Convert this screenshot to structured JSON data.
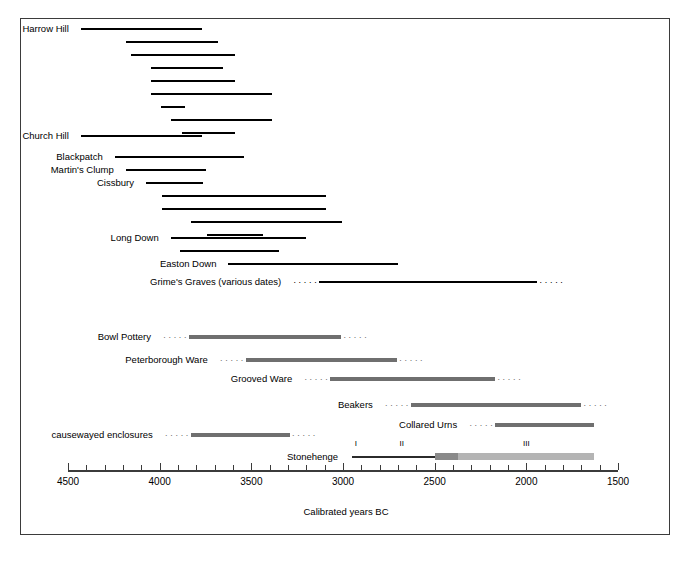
{
  "chart_data": {
    "type": "bar",
    "title": "",
    "xlabel": "Calibrated years BC",
    "ylabel": "",
    "xlim": [
      4500,
      1500
    ],
    "x_axis_reversed": true,
    "tick_interval": 100,
    "label_interval": 500,
    "tick_labels": [
      "4500",
      "4000",
      "3500",
      "3000",
      "2500",
      "2000",
      "1500"
    ],
    "grid": false,
    "legend": null,
    "series": [
      {
        "name": "Harrow Hill",
        "label": "Harrow Hill",
        "style": "solid-black",
        "bars": [
          {
            "start": 4430,
            "end": 3770
          },
          {
            "start": 4185,
            "end": 3680
          },
          {
            "start": 4155,
            "end": 3590
          },
          {
            "start": 4050,
            "end": 3655
          },
          {
            "start": 4050,
            "end": 3590
          },
          {
            "start": 4050,
            "end": 3385
          },
          {
            "start": 3995,
            "end": 3860
          },
          {
            "start": 3940,
            "end": 3385
          },
          {
            "start": 3880,
            "end": 3590
          }
        ]
      },
      {
        "name": "Church Hill",
        "label": "Church Hill",
        "style": "solid-black",
        "bars": [
          {
            "start": 4430,
            "end": 3770
          }
        ]
      },
      {
        "name": "Blackpatch",
        "label": "Blackpatch",
        "style": "solid-black",
        "bars": [
          {
            "start": 4245,
            "end": 3540
          }
        ]
      },
      {
        "name": "Martin's Clump",
        "label": "Martin's Clump",
        "style": "solid-black",
        "bars": [
          {
            "start": 4185,
            "end": 3745
          }
        ]
      },
      {
        "name": "Cissbury",
        "label": "Cissbury",
        "style": "solid-black",
        "bars": [
          {
            "start": 4075,
            "end": 3765
          },
          {
            "start": 3990,
            "end": 3095
          },
          {
            "start": 3985,
            "end": 3090
          },
          {
            "start": 3830,
            "end": 3005
          },
          {
            "start": 3740,
            "end": 3435
          }
        ]
      },
      {
        "name": "Long Down",
        "label": "Long Down",
        "style": "solid-black",
        "bars": [
          {
            "start": 3940,
            "end": 3200
          },
          {
            "start": 3890,
            "end": 3350
          }
        ]
      },
      {
        "name": "Easton Down",
        "label": "Easton Down",
        "style": "solid-black",
        "bars": [
          {
            "start": 3625,
            "end": 2700
          }
        ]
      },
      {
        "name": "Grime's Graves (various dates)",
        "label": "Grime's Graves (various dates)",
        "style": "solid-black-dotted-ends",
        "bars": [
          {
            "start": 3130,
            "end": 1940,
            "dotted_left": true,
            "dotted_right": true
          }
        ]
      },
      {
        "name": "Bowl Pottery",
        "label": "Bowl Pottery",
        "style": "gray-dotted-ends",
        "bars": [
          {
            "start": 3840,
            "end": 3010,
            "dotted_left": true,
            "dotted_right": true
          }
        ]
      },
      {
        "name": "Peterborough Ware",
        "label": "Peterborough Ware",
        "style": "gray-dotted-ends",
        "bars": [
          {
            "start": 3530,
            "end": 2705,
            "dotted_left": true,
            "dotted_right": true
          }
        ]
      },
      {
        "name": "Grooved Ware",
        "label": "Grooved Ware",
        "style": "gray-dotted-ends",
        "bars": [
          {
            "start": 3070,
            "end": 2170,
            "dotted_left": true,
            "dotted_right": true
          }
        ]
      },
      {
        "name": "Beakers",
        "label": "Beakers",
        "style": "gray-dotted-ends",
        "bars": [
          {
            "start": 2630,
            "end": 1700,
            "dotted_left": true,
            "dotted_right": true
          }
        ]
      },
      {
        "name": "Collared Urns",
        "label": "Collared Urns",
        "style": "gray-dotted-ends",
        "bars": [
          {
            "start": 2170,
            "end": 1630,
            "dotted_left": true,
            "dotted_right": false
          }
        ]
      },
      {
        "name": "causewayed enclosures",
        "label": "causewayed enclosures",
        "style": "gray-dotted-ends",
        "bars": [
          {
            "start": 3830,
            "end": 3290,
            "dotted_left": true,
            "dotted_right": true
          }
        ]
      },
      {
        "name": "Stonehenge",
        "label": "Stonehenge",
        "style": "stonehenge-phases",
        "bars": [
          {
            "start": 2950,
            "end": 2500,
            "phase": "I",
            "weight": "thin"
          },
          {
            "start": 2500,
            "end": 2375,
            "phase": "II",
            "weight": "medium"
          },
          {
            "start": 2375,
            "end": 1630,
            "phase": "III",
            "weight": "light"
          }
        ],
        "phase_markers": [
          {
            "label": "I",
            "year": 2930
          },
          {
            "label": "II",
            "year": 2680
          },
          {
            "label": "III",
            "year": 2000
          }
        ]
      }
    ],
    "colors": {
      "bar_black": "#000000",
      "bar_gray": "#6f6f6f",
      "stonehenge_mid": "#8a8a8a",
      "stonehenge_light": "#b4b4b4",
      "axis": "#3b3b3b",
      "frame": "#3b3b3b",
      "background": "#ffffff"
    }
  },
  "geometry": {
    "axis_x_left": 68,
    "axis_x_right": 618,
    "axis_y": 470,
    "row_tops": {
      "harrow_hill": [
        22,
        35,
        48,
        61,
        74,
        87,
        100,
        113,
        126
      ],
      "church_hill": 129,
      "blackpatch": 150,
      "martins_clump": 163,
      "cissbury": [
        176,
        189,
        202,
        215,
        228
      ],
      "long_down": [
        231,
        244
      ],
      "easton_down": 257,
      "grimes_graves": 275,
      "bowl_pottery": 330,
      "peterborough_ware": 353,
      "grooved_ware": 372,
      "beakers": 398,
      "collared_urns": 418,
      "causewayed_enclosures": 428,
      "stonehenge": 450
    }
  }
}
